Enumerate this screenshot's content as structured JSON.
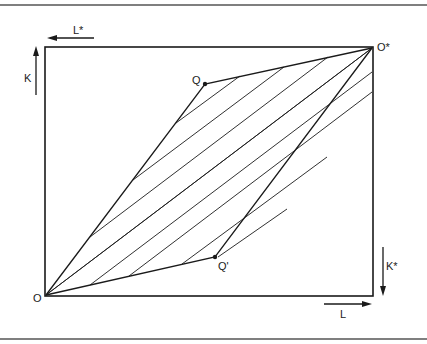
{
  "diagram": {
    "type": "edgeworth-box",
    "labels": {
      "origin": "O",
      "origin_star": "O*",
      "point_q": "Q",
      "point_q_prime": "Q'",
      "axis_k": "K",
      "axis_l": "L",
      "axis_k_star": "K*",
      "axis_l_star": "L*"
    },
    "colors": {
      "line": "#1a1a1a",
      "frame": "#555555",
      "background": "#ffffff"
    }
  }
}
